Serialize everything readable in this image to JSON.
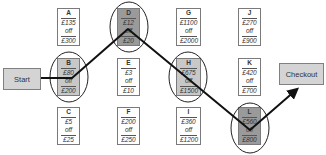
{
  "start": {
    "label": "Start"
  },
  "checkout": {
    "label": "Checkout"
  },
  "nodes": {
    "A": {
      "id": "A",
      "discount": "£135",
      "word": "off",
      "spend": "£300"
    },
    "B": {
      "id": "B",
      "discount": "£80",
      "word": "off",
      "spend": "£200"
    },
    "C": {
      "id": "C",
      "discount": "£5",
      "word": "off",
      "spend": "£25"
    },
    "D": {
      "id": "D",
      "discount": "£12",
      "word": "off",
      "spend": "£20"
    },
    "E": {
      "id": "E",
      "discount": "£3",
      "word": "off",
      "spend": "£10"
    },
    "F": {
      "id": "F",
      "discount": "£200",
      "word": "off",
      "spend": "£250"
    },
    "G": {
      "id": "G",
      "discount": "£1100",
      "word": "off",
      "spend": "£2000"
    },
    "H": {
      "id": "H",
      "discount": "£675",
      "word": "off",
      "spend": "£1500"
    },
    "I": {
      "id": "I",
      "discount": "£360",
      "word": "off",
      "spend": "£1200"
    },
    "J": {
      "id": "J",
      "discount": "£270",
      "word": "off",
      "spend": "£900"
    },
    "K": {
      "id": "K",
      "discount": "£420",
      "word": "off",
      "spend": "£700"
    },
    "L": {
      "id": "L",
      "discount": "£560",
      "word": "off",
      "spend": "£800"
    }
  },
  "path": [
    "Start",
    "B",
    "D",
    "H",
    "L",
    "Checkout"
  ],
  "colors": {
    "selected_light": "#c8c8c8",
    "selected_dark": "#9a9a9a",
    "terminal": "#d4d4d4",
    "line": "#111111"
  }
}
